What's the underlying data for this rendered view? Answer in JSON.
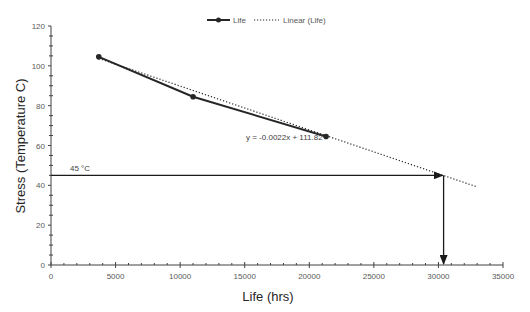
{
  "chart_data": {
    "type": "scatter",
    "title": "",
    "xlabel": "Life (hrs)",
    "ylabel": "Stress (Temperature C)",
    "xlim": [
      0,
      35000
    ],
    "ylim": [
      0,
      120
    ],
    "x_ticks": [
      0,
      5000,
      10000,
      15000,
      20000,
      25000,
      30000,
      35000
    ],
    "y_ticks": [
      0,
      20,
      40,
      60,
      80,
      100,
      120
    ],
    "x_minor_step": 1000,
    "y_minor_step": 5,
    "grid": false,
    "legend_position": "top",
    "legend": [
      "Life",
      "Linear (Life)"
    ],
    "series": [
      {
        "name": "Life",
        "style": "solid line with circle markers",
        "color": "#262626",
        "x": [
          3700,
          11000,
          21300
        ],
        "y": [
          104.5,
          84.5,
          64.5
        ]
      },
      {
        "name": "Linear (Life)",
        "style": "dotted trendline",
        "color": "#262626",
        "x": [
          3700,
          33000
        ],
        "y": [
          103.7,
          39.2
        ],
        "equation": "y = -0.0022x + 111.82"
      }
    ],
    "annotations": [
      {
        "text": "45 °C",
        "type": "horizontal-arrow",
        "from": [
          0,
          45
        ],
        "to": [
          30400,
          45
        ]
      },
      {
        "text": "",
        "type": "vertical-arrow",
        "from": [
          30400,
          45
        ],
        "to": [
          30400,
          0
        ]
      },
      {
        "text": "y = -0.0022x + 111.82",
        "type": "equation-label",
        "at": [
          21000,
          62
        ]
      }
    ]
  },
  "labels": {
    "x_title": "Life (hrs)",
    "y_title": "Stress (Temperature C)",
    "legend_life": "Life",
    "legend_linear": "Linear (Life)",
    "equation": "y = -0.0022x + 111.82",
    "temp_label": "45 °C",
    "x_ticks": [
      "0",
      "5000",
      "10000",
      "15000",
      "20000",
      "25000",
      "30000",
      "35000"
    ],
    "y_ticks": [
      "0",
      "20",
      "40",
      "60",
      "80",
      "100",
      "120"
    ]
  }
}
